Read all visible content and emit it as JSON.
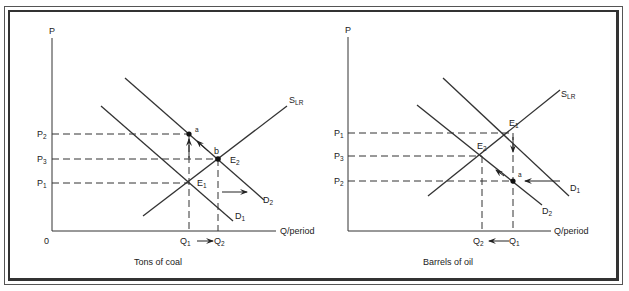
{
  "panels": [
    {
      "id": "coal",
      "caption": "Tons of coal",
      "y_axis_label": "P",
      "x_axis_label": "Q/period",
      "origin_label": "0",
      "price_labels": [
        {
          "main": "P",
          "sub": "2"
        },
        {
          "main": "P",
          "sub": "3"
        },
        {
          "main": "P",
          "sub": "1"
        }
      ],
      "quantity_labels": [
        {
          "main": "Q",
          "sub": "1"
        },
        {
          "main": "Q",
          "sub": "2"
        }
      ],
      "curves": {
        "supply": {
          "main": "S",
          "sub": "LR"
        },
        "demand_1": {
          "main": "D",
          "sub": "1"
        },
        "demand_2": {
          "main": "D",
          "sub": "2"
        }
      },
      "points": {
        "e1": {
          "main": "E",
          "sub": "1"
        },
        "e2": {
          "main": "E",
          "sub": "2"
        },
        "a": "a",
        "b": "b"
      }
    },
    {
      "id": "oil",
      "caption": "Barrels of oil",
      "y_axis_label": "P",
      "x_axis_label": "Q/period",
      "price_labels": [
        {
          "main": "P",
          "sub": "1"
        },
        {
          "main": "P",
          "sub": "3"
        },
        {
          "main": "P",
          "sub": "2"
        }
      ],
      "quantity_labels": [
        {
          "main": "Q",
          "sub": "2"
        },
        {
          "main": "Q",
          "sub": "1"
        }
      ],
      "curves": {
        "supply": {
          "main": "S",
          "sub": "LR"
        },
        "demand_1": {
          "main": "D",
          "sub": "1"
        },
        "demand_2": {
          "main": "D",
          "sub": "2"
        }
      },
      "points": {
        "e1": {
          "main": "E",
          "sub": "1"
        },
        "e2": {
          "main": "E",
          "sub": "2"
        },
        "a": "a"
      }
    }
  ]
}
